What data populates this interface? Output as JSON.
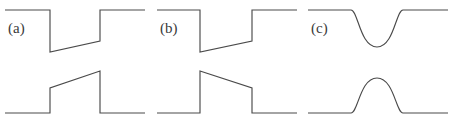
{
  "figure": {
    "width": 453,
    "height": 122,
    "background_color": "#ffffff",
    "line_color": "#4a4a4a",
    "label_color": "#3a3a3a"
  },
  "panels": [
    {
      "label": "(a)",
      "label_x": 8,
      "label_y": 21,
      "origin_x": 0,
      "description": "falling edge with slow linear ramp then abrupt rise; mirrored below as abrupt rise with slow linear ramp then fall",
      "traces": [
        {
          "name": "upper-trace",
          "shape": "polyline",
          "points": "5,10 50,10 50,52 100,41 100,10 145,10"
        },
        {
          "name": "lower-trace",
          "shape": "polyline",
          "points": "5,113 50,113 50,88 100,71 100,113 145,113"
        }
      ]
    },
    {
      "label": "(b)",
      "label_x": 160,
      "label_y": 21,
      "origin_x": 151,
      "description": "falling edge to a low level that ramps up slowly then steps high; mirrored below as abrupt rise that ramps down slowly then steps low",
      "traces": [
        {
          "name": "upper-trace",
          "shape": "polyline",
          "points": "157,10 200,10 200,52 252,41 252,10 297,10"
        },
        {
          "name": "lower-trace",
          "shape": "polyline",
          "points": "157,113 200,113 200,71 252,88 252,113 297,113"
        }
      ]
    },
    {
      "label": "(c)",
      "label_x": 311,
      "label_y": 21,
      "origin_x": 302,
      "description": "smooth rounded dip in the upper trace and matching smooth rounded bump in the lower trace",
      "traces": [
        {
          "name": "upper-trace",
          "shape": "path",
          "d": "M 308,10 L 351,10 C 358,10 360,47 377,47 C 394,47 396,10 403,10 L 448,10"
        },
        {
          "name": "lower-trace",
          "shape": "path",
          "d": "M 308,113 L 351,113 C 358,113 360,78 377,78 C 394,78 396,113 403,113 L 448,113"
        }
      ]
    }
  ]
}
